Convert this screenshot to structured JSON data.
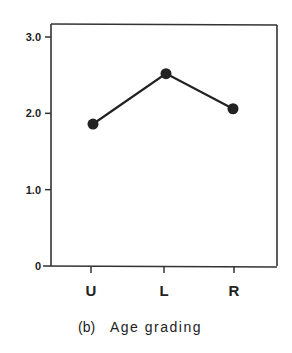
{
  "chart_data": {
    "type": "line",
    "title": "",
    "caption": "(b)  Age grading",
    "caption_label": "(b)",
    "caption_text": "Age grading",
    "xlabel": "",
    "ylabel": "",
    "categories": [
      "U",
      "L",
      "R"
    ],
    "series": [
      {
        "name": "Age grading",
        "values": [
          1.86,
          2.52,
          2.06
        ],
        "marker": "filled-circle",
        "color": "#222222"
      }
    ],
    "ylim": [
      0,
      3.0
    ],
    "yticks": [
      0,
      1.0,
      2.0,
      3.0
    ],
    "ytick_labels": [
      "0",
      "1.0",
      "2.0",
      "3.0"
    ],
    "grid": false,
    "legend": "none",
    "frame": "box"
  }
}
